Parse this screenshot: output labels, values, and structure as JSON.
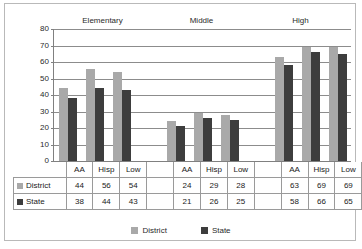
{
  "chart_data": {
    "type": "bar",
    "title": "",
    "xlabel": "",
    "ylabel": "",
    "ylim": [
      0,
      80
    ],
    "ytick_step": 10,
    "yticks": [
      0,
      10,
      20,
      30,
      40,
      50,
      60,
      70,
      80
    ],
    "grid": true,
    "legend_position": "bottom",
    "group_labels": [
      "Elementary",
      "Middle",
      "High"
    ],
    "categories": [
      "AA",
      "Hisp",
      "Low",
      "",
      "AA",
      "Hisp",
      "Low",
      "",
      "AA",
      "Hisp",
      "Low"
    ],
    "series": [
      {
        "name": "District",
        "color": "#a9a9a9",
        "values": [
          44,
          56,
          54,
          null,
          24,
          29,
          28,
          null,
          63,
          69,
          69
        ]
      },
      {
        "name": "State",
        "color": "#3d3d3d",
        "values": [
          38,
          44,
          43,
          null,
          21,
          26,
          25,
          null,
          58,
          66,
          65
        ]
      }
    ]
  },
  "table": {
    "header_row": [
      "",
      "AA",
      "Hisp",
      "Low",
      "",
      "AA",
      "Hisp",
      "Low",
      "",
      "AA",
      "Hisp",
      "Low"
    ],
    "rows": [
      {
        "label": "District",
        "swatch": "district-swatch",
        "values": [
          "44",
          "56",
          "54",
          "",
          "24",
          "29",
          "28",
          "",
          "63",
          "69",
          "69"
        ]
      },
      {
        "label": "State",
        "swatch": "state-swatch",
        "values": [
          "38",
          "44",
          "43",
          "",
          "21",
          "26",
          "25",
          "",
          "58",
          "66",
          "65"
        ]
      }
    ]
  },
  "legend": {
    "items": [
      {
        "label": "District",
        "color": "#a9a9a9"
      },
      {
        "label": "State",
        "color": "#3d3d3d"
      }
    ]
  }
}
